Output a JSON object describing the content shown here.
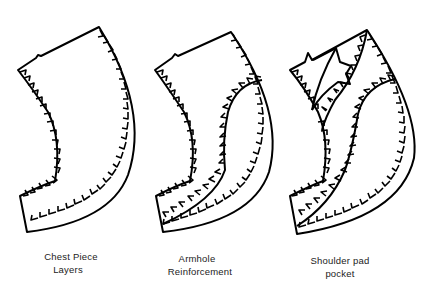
{
  "diagram": {
    "type": "garment pattern pieces with pinked (zigzag) edges",
    "stroke_color": "#000000",
    "background": "#ffffff",
    "pieces": [
      {
        "id": "chest-piece",
        "label_line1": "Chest Piece",
        "label_line2": "Layers"
      },
      {
        "id": "armhole",
        "label_line1": "Armhole",
        "label_line2": "Reinforcement"
      },
      {
        "id": "shoulder-pad",
        "label_line1": "Shoulder pad",
        "label_line2": "pocket"
      }
    ]
  }
}
